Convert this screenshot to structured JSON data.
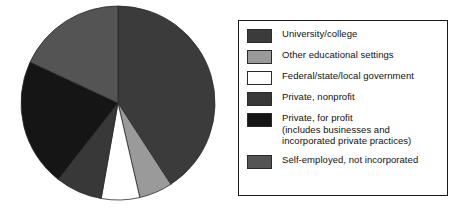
{
  "chart_data": {
    "type": "pie",
    "title": "",
    "subtitle": "",
    "xlabel": "",
    "ylabel": "",
    "grid": false,
    "legend_position": "right",
    "start_angle_deg": 0,
    "direction": "clockwise",
    "center": {
      "x": 118,
      "y": 103
    },
    "radius": 97,
    "categories": [
      "University/college",
      "Other educational settings",
      "Federal/state/local government",
      "Private, nonprofit",
      "Private, for profit (includes businesses and incorporated private practices)",
      "Self-employed, not incorporated"
    ],
    "values": [
      41,
      5.5,
      6.5,
      8,
      21,
      18
    ],
    "units": "percent",
    "slice_angles_deg": [
      {
        "start": 0,
        "end": 147
      },
      {
        "start": 147,
        "end": 167
      },
      {
        "start": 167,
        "end": 190
      },
      {
        "start": 190,
        "end": 218
      },
      {
        "start": 218,
        "end": 295
      },
      {
        "start": 295,
        "end": 360
      }
    ],
    "colors": [
      "#3b3b3b",
      "#9a9a9a",
      "#ffffff",
      "#383838",
      "#151515",
      "#545454"
    ],
    "annotations": []
  },
  "legend": {
    "border_color": "#1a1a1a",
    "items": [
      {
        "label": "University/college",
        "color": "#3b3b3b",
        "swatch_name": "legend-swatch-university-college"
      },
      {
        "label": "Other educational settings",
        "color": "#9a9a9a",
        "swatch_name": "legend-swatch-other-educational-settings"
      },
      {
        "label": "Federal/state/local government",
        "color": "#ffffff",
        "swatch_name": "legend-swatch-federal-state-local-government"
      },
      {
        "label": "Private, nonprofit",
        "color": "#383838",
        "swatch_name": "legend-swatch-private-nonprofit"
      },
      {
        "label": "Private, for profit\n(includes businesses and\nincorporated private practices)",
        "color": "#151515",
        "swatch_name": "legend-swatch-private-for-profit"
      },
      {
        "label": "Self-employed, not incorporated",
        "color": "#545454",
        "swatch_name": "legend-swatch-self-employed-not-incorporated"
      }
    ]
  }
}
